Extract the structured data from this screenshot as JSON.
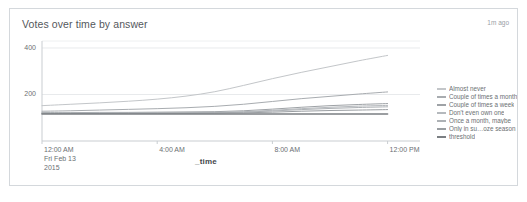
{
  "panel": {
    "title": "Votes over time by answer",
    "timestamp": "1m ago",
    "border_color": "#d4d8dc",
    "background": "#ffffff"
  },
  "chart_data": {
    "type": "line",
    "title": "Votes over time by answer",
    "xlabel": "_time",
    "ylabel": "",
    "ylim": [
      0,
      430
    ],
    "xlim": [
      0,
      12.5
    ],
    "grid": true,
    "legend_position": "right",
    "y_ticks": [
      "200",
      "400"
    ],
    "y_tick_values": [
      200,
      400
    ],
    "x_ticks": [
      {
        "time": "12:00 AM",
        "date": "Fri Feb 13",
        "year": "2015",
        "x": 0
      },
      {
        "time": "4:00 AM",
        "date": "",
        "year": "",
        "x": 4
      },
      {
        "time": "8:00 AM",
        "date": "",
        "year": "",
        "x": 8
      },
      {
        "time": "12:00 PM",
        "date": "",
        "year": "",
        "x": 12
      }
    ],
    "x": [
      0,
      1,
      2,
      3,
      4,
      5,
      6,
      7,
      8,
      9,
      10,
      11,
      12
    ],
    "series": [
      {
        "name": "Almost never",
        "color": "#c3c6c9",
        "values": [
          152,
          158,
          164,
          171,
          180,
          193,
          212,
          239,
          268,
          295,
          320,
          345,
          368
        ]
      },
      {
        "name": "Couple of times a month",
        "color": "#a8acb0",
        "values": [
          128,
          130,
          133,
          136,
          139,
          143,
          149,
          158,
          170,
          182,
          192,
          202,
          211
        ]
      },
      {
        "name": "Couple of times a week",
        "color": "#9ea2a6",
        "values": [
          122,
          122,
          123,
          123,
          124,
          125,
          126,
          130,
          137,
          145,
          152,
          157,
          161
        ]
      },
      {
        "name": "Don't even own one",
        "color": "#b5b9bd",
        "values": [
          120,
          120,
          121,
          121,
          122,
          122,
          123,
          126,
          132,
          139,
          145,
          150,
          153
        ]
      },
      {
        "name": "Once a month, maybe",
        "color": "#adb1b5",
        "values": [
          119,
          119,
          119,
          120,
          120,
          121,
          121,
          124,
          129,
          135,
          140,
          144,
          147
        ]
      },
      {
        "name": "Only in su…oze season",
        "color": "#9a9ea2",
        "values": [
          118,
          118,
          118,
          119,
          119,
          119,
          120,
          121,
          124,
          128,
          131,
          133,
          135
        ]
      },
      {
        "name": "threshold",
        "color": "#7b7f83",
        "values": [
          116,
          116,
          116,
          116,
          116,
          116,
          116,
          116,
          116,
          116,
          116,
          116,
          116
        ]
      }
    ]
  }
}
